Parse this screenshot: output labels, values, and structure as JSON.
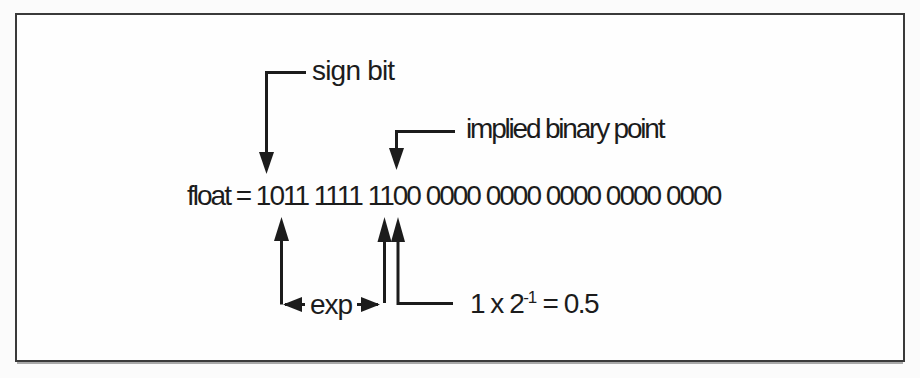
{
  "diagram": {
    "float_line": "float = 1011 1111 1100 0000 0000 0000 0000 0000",
    "float_prefix": "float =",
    "bit_groups": [
      "1011",
      "1111",
      "1100",
      "0000",
      "0000",
      "0000",
      "0000",
      "0000"
    ],
    "labels": {
      "sign_bit": "sign bit",
      "implied_binary_point": "implied binary point",
      "exp": "exp",
      "value_base": "1 x 2",
      "value_sup": "-1",
      "value_rest": " = 0.5"
    },
    "colors": {
      "ink": "#1c1c1c",
      "frame_border": "#3a3a3a",
      "background": "#fbfbfb",
      "paper": "#fefefe"
    }
  }
}
